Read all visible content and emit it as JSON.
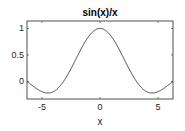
{
  "chart_data": {
    "type": "line",
    "title": "sin(x)/x",
    "xlabel": "x",
    "ylabel": "",
    "function": "sin(x)/x",
    "xlim": [
      -6.2832,
      6.2832
    ],
    "ylim": [
      -0.33,
      1.14
    ],
    "xticks": [
      -5,
      0,
      5
    ],
    "xtick_labels": [
      "-5",
      "0",
      "5"
    ],
    "yticks": [
      0,
      0.5,
      1
    ],
    "ytick_labels": [
      "0",
      "0.5",
      "1"
    ],
    "grid": false,
    "legend": "none",
    "series": [
      {
        "name": "sin(x)/x",
        "color": "#333333",
        "x": [
          -6.2832,
          -5.5,
          -4.4934,
          -3.5,
          -3.1416,
          -2.5,
          -2.0,
          -1.5,
          -1.0,
          -0.5,
          0,
          0.5,
          1.0,
          1.5,
          2.0,
          2.5,
          3.1416,
          3.5,
          4.4934,
          5.5,
          6.2832
        ],
        "y": [
          0,
          -0.1282,
          -0.2172,
          -0.1002,
          0,
          0.2394,
          0.4546,
          0.665,
          0.8415,
          0.9589,
          1,
          0.9589,
          0.8415,
          0.665,
          0.4546,
          0.2394,
          0,
          -0.1002,
          -0.2172,
          -0.1282,
          0
        ]
      }
    ]
  }
}
